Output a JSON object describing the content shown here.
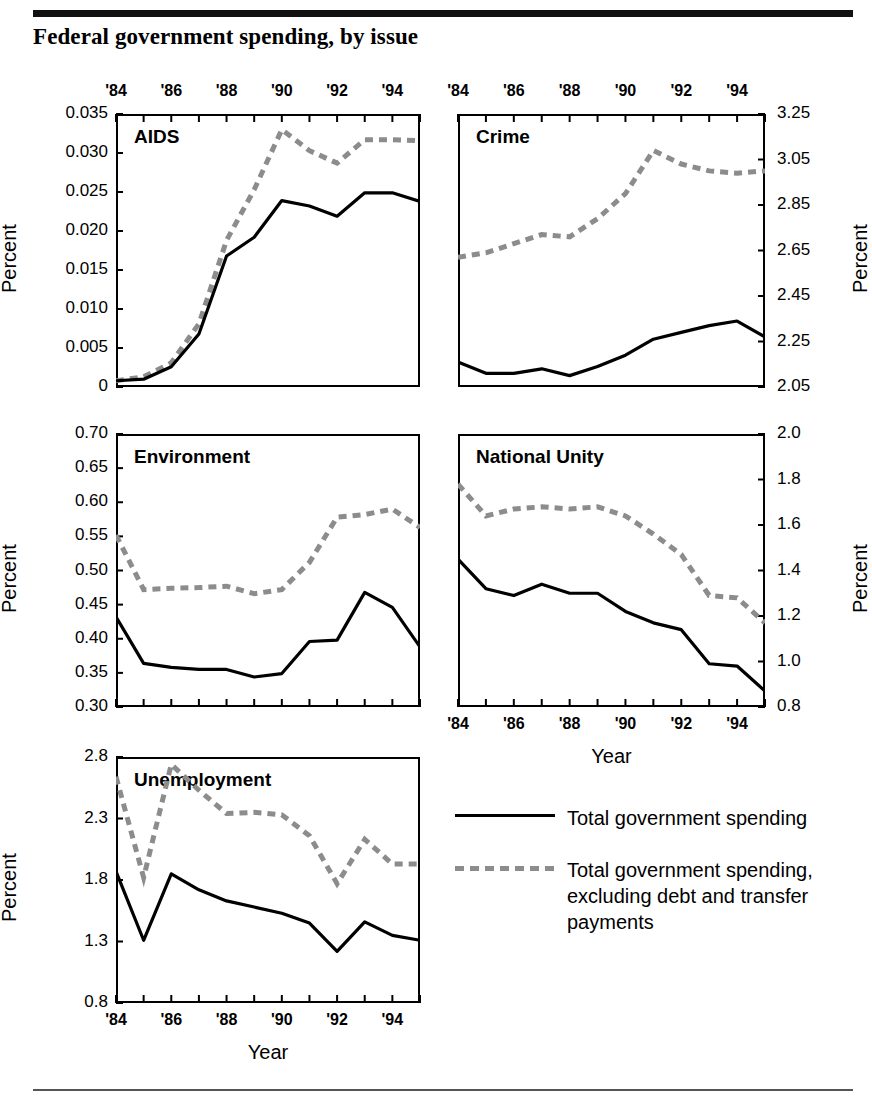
{
  "figure": {
    "title": "Federal government spending, by issue",
    "x_axis_label": "Year",
    "y_axis_label": "Percent"
  },
  "legend": {
    "items": [
      {
        "key": "solid-line-key",
        "label": "Total government spending"
      },
      {
        "key": "dashed-line-key",
        "label": "Total government spending, excluding debt and transfer payments"
      }
    ]
  },
  "colors": {
    "solid_series": "#000000",
    "dashed_series": "#8c8c8c",
    "axis": "#000000",
    "background": "#ffffff"
  },
  "chart_data": [
    {
      "type": "line",
      "title": "AIDS",
      "xlabel": "Year",
      "ylabel": "Percent",
      "x": [
        1984,
        1985,
        1986,
        1987,
        1988,
        1989,
        1990,
        1991,
        1992,
        1993,
        1994,
        1995
      ],
      "xtick_labels": [
        "'84",
        "'86",
        "'88",
        "'90",
        "'92",
        "'94"
      ],
      "xlim": [
        1984,
        1995
      ],
      "ylim": [
        0,
        0.035
      ],
      "ytick_labels": [
        "0",
        "0.005",
        "0.010",
        "0.015",
        "0.020",
        "0.025",
        "0.030",
        "0.035"
      ],
      "ytick_values": [
        0,
        0.005,
        0.01,
        0.015,
        0.02,
        0.025,
        0.03,
        0.035
      ],
      "grid": false,
      "series": [
        {
          "name": "Total government spending",
          "values": [
            0.0008,
            0.001,
            0.0026,
            0.0068,
            0.0168,
            0.0192,
            0.0239,
            0.0232,
            0.0219,
            0.0249,
            0.0249,
            0.0238
          ]
        },
        {
          "name": "Total government spending, excluding debt and transfer payments",
          "values": [
            0.0008,
            0.0013,
            0.0031,
            0.0081,
            0.0188,
            0.0253,
            0.033,
            0.0303,
            0.0287,
            0.0317,
            0.0317,
            0.0316
          ]
        }
      ]
    },
    {
      "type": "line",
      "title": "Crime",
      "xlabel": "Year",
      "ylabel": "Percent",
      "x": [
        1984,
        1985,
        1986,
        1987,
        1988,
        1989,
        1990,
        1991,
        1992,
        1993,
        1994,
        1995
      ],
      "xtick_labels": [
        "'84",
        "'86",
        "'88",
        "'90",
        "'92",
        "'94"
      ],
      "xlim": [
        1984,
        1995
      ],
      "ylim": [
        2.05,
        3.25
      ],
      "ytick_labels": [
        "2.05",
        "2.25",
        "2.45",
        "2.65",
        "2.85",
        "3.05",
        "3.25"
      ],
      "ytick_values": [
        2.05,
        2.25,
        2.45,
        2.65,
        2.85,
        3.05,
        3.25
      ],
      "grid": false,
      "series": [
        {
          "name": "Total government spending",
          "values": [
            2.16,
            2.11,
            2.11,
            2.13,
            2.1,
            2.14,
            2.19,
            2.26,
            2.29,
            2.32,
            2.34,
            2.27
          ]
        },
        {
          "name": "Total government spending, excluding debt and transfer payments",
          "values": [
            2.62,
            2.64,
            2.68,
            2.72,
            2.71,
            2.79,
            2.9,
            3.09,
            3.03,
            3.0,
            2.99,
            3.0
          ]
        }
      ]
    },
    {
      "type": "line",
      "title": "Environment",
      "xlabel": "Year",
      "ylabel": "Percent",
      "x": [
        1984,
        1985,
        1986,
        1987,
        1988,
        1989,
        1990,
        1991,
        1992,
        1993,
        1994,
        1995
      ],
      "xtick_labels": [
        "'84",
        "'86",
        "'88",
        "'90",
        "'92",
        "'94"
      ],
      "xlim": [
        1984,
        1995
      ],
      "ylim": [
        0.3,
        0.7
      ],
      "ytick_labels": [
        "0.30",
        "0.35",
        "0.40",
        "0.45",
        "0.50",
        "0.55",
        "0.60",
        "0.65",
        "0.70"
      ],
      "ytick_values": [
        0.3,
        0.35,
        0.4,
        0.45,
        0.5,
        0.55,
        0.6,
        0.65,
        0.7
      ],
      "grid": false,
      "series": [
        {
          "name": "Total government spending",
          "values": [
            0.432,
            0.364,
            0.358,
            0.355,
            0.355,
            0.344,
            0.349,
            0.396,
            0.398,
            0.468,
            0.446,
            0.462
          ]
        },
        {
          "name": "Total government spending, excluding debt and transfer payments",
          "values": [
            0.552,
            0.472,
            0.474,
            0.475,
            0.477,
            0.466,
            0.472,
            0.512,
            0.578,
            0.582,
            0.59,
            0.672
          ]
        }
      ],
      "series_extra_note": "series continue to 1995: solid 0.388, dashed 0.563"
    },
    {
      "type": "line",
      "title": "National Unity",
      "xlabel": "Year",
      "ylabel": "Percent",
      "x": [
        1984,
        1985,
        1986,
        1987,
        1988,
        1989,
        1990,
        1991,
        1992,
        1993,
        1994,
        1995
      ],
      "xtick_labels": [
        "'84",
        "'86",
        "'88",
        "'90",
        "'92",
        "'94"
      ],
      "xlim": [
        0.8,
        2.0
      ],
      "ylim": [
        0.8,
        2.0
      ],
      "ytick_labels": [
        "0.8",
        "1.0",
        "1.2",
        "1.4",
        "1.6",
        "1.8",
        "2.0"
      ],
      "ytick_values": [
        0.8,
        1.0,
        1.2,
        1.4,
        1.6,
        1.8,
        2.0
      ],
      "grid": false,
      "series": [
        {
          "name": "Total government spending",
          "values": [
            1.45,
            1.32,
            1.29,
            1.34,
            1.3,
            1.3,
            1.22,
            1.17,
            1.14,
            0.99,
            0.98,
            0.87
          ]
        },
        {
          "name": "Total government spending, excluding debt and transfer payments",
          "values": [
            1.78,
            1.64,
            1.67,
            1.68,
            1.67,
            1.68,
            1.64,
            1.56,
            1.47,
            1.29,
            1.28,
            1.17
          ]
        }
      ]
    },
    {
      "type": "line",
      "title": "Unemployment",
      "xlabel": "Year",
      "ylabel": "Percent",
      "x": [
        1984,
        1985,
        1986,
        1987,
        1988,
        1989,
        1990,
        1991,
        1992,
        1993,
        1994,
        1995
      ],
      "xtick_labels": [
        "'84",
        "'86",
        "'88",
        "'90",
        "'92",
        "'94"
      ],
      "xlim": [
        1984,
        1995
      ],
      "ylim": [
        0.8,
        2.8
      ],
      "ytick_labels": [
        "0.8",
        "1.3",
        "1.8",
        "2.3",
        "2.8"
      ],
      "ytick_values": [
        0.8,
        1.3,
        1.8,
        2.3,
        2.8
      ],
      "grid": false,
      "series": [
        {
          "name": "Total government spending",
          "values": [
            1.87,
            1.31,
            1.85,
            1.72,
            1.63,
            1.58,
            1.53,
            1.45,
            1.22,
            1.46,
            1.35,
            1.31
          ]
        },
        {
          "name": "Total government spending, excluding debt and transfer payments",
          "values": [
            2.64,
            1.82,
            2.74,
            2.53,
            2.34,
            2.35,
            2.33,
            2.16,
            1.77,
            2.13,
            1.93,
            1.93
          ]
        }
      ]
    }
  ]
}
